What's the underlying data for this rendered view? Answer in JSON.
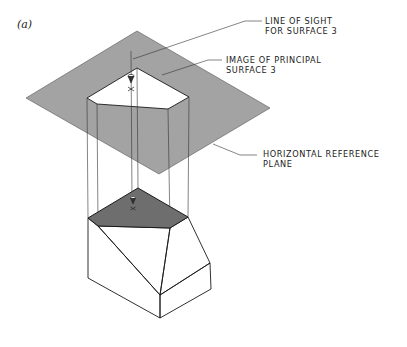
{
  "figure": {
    "label": "(a)"
  },
  "callouts": {
    "line_of_sight": {
      "line1": "LINE OF SIGHT",
      "line2": "FOR SURFACE 3"
    },
    "image_of_principal": {
      "line1": "IMAGE OF PRINCIPAL",
      "line2": "SURFACE 3"
    },
    "reference_plane": {
      "line1": "HORIZONTAL REFERENCE",
      "line2": "PLANE"
    }
  },
  "colors": {
    "plane_fill": "#a3a3a3",
    "projected_image_fill": "#ffffff",
    "principal_surface_fill": "#6e6e6e",
    "solid_face_fill": "#ffffff",
    "line_color": "#1a1a1a"
  }
}
